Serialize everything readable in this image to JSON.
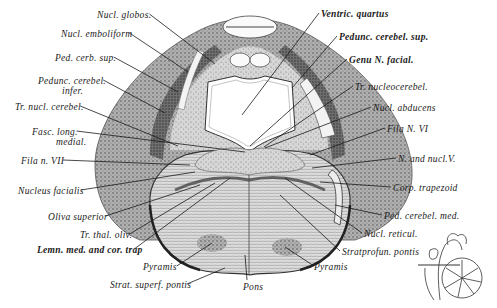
{
  "figure": {
    "labels": [
      {
        "id": "nucl-globos",
        "text": "Nucl. globos.",
        "x": 97,
        "y": 18,
        "anchor": "left",
        "tx": 215,
        "ty": 64,
        "bold": false
      },
      {
        "id": "nucl-emboliform",
        "text": "Nucl. emboliform",
        "x": 61,
        "y": 37,
        "anchor": "left",
        "tx": 188,
        "ty": 72,
        "bold": false
      },
      {
        "id": "ped-cerb-sup",
        "text": "Ped. cerb. sup.",
        "x": 55,
        "y": 61,
        "anchor": "left",
        "tx": 178,
        "ty": 92,
        "bold": false
      },
      {
        "id": "pedunc-cerebel-infer",
        "text": "Pedunc. cerebel.",
        "text2": "infer.",
        "x": 38,
        "y": 84,
        "anchor": "left",
        "tx": 165,
        "ty": 113,
        "bold": false
      },
      {
        "id": "tr-nucl-cerebel",
        "text": "Tr. nucl. cerebel.",
        "x": 15,
        "y": 110,
        "anchor": "left",
        "tx": 178,
        "ty": 146,
        "bold": false
      },
      {
        "id": "fasc-long-medial",
        "text": "Fasc. long.",
        "text2": "medial.",
        "x": 32,
        "y": 135,
        "anchor": "left",
        "tx": 245,
        "ty": 152,
        "bold": false
      },
      {
        "id": "fila-n-vii",
        "text": "Fila n. VII",
        "x": 21,
        "y": 164,
        "anchor": "left",
        "tx": 190,
        "ty": 165,
        "bold": false
      },
      {
        "id": "nucleus-facialis",
        "text": "Nucleus facialis",
        "x": 18,
        "y": 194,
        "anchor": "left",
        "tx": 195,
        "ty": 172,
        "bold": false
      },
      {
        "id": "oliva-superior",
        "text": "Oliva superior",
        "x": 48,
        "y": 220,
        "anchor": "left",
        "tx": 200,
        "ty": 185,
        "bold": false
      },
      {
        "id": "tr-thal-oliv",
        "text": "Tr. thal. oliv.",
        "x": 80,
        "y": 238,
        "anchor": "left",
        "tx": 215,
        "ty": 183,
        "bold": false
      },
      {
        "id": "lemn-med-cor-trap",
        "text": "Lemn. med. and cor. trap",
        "x": 37,
        "y": 253,
        "anchor": "left",
        "tx": 230,
        "ty": 178,
        "bold": true
      },
      {
        "id": "pyramis-left",
        "text": "Pyramis",
        "x": 143,
        "y": 270,
        "anchor": "left",
        "tx": 212,
        "ty": 243,
        "bold": false
      },
      {
        "id": "strat-superf-pontis",
        "text": "Strat. superf. pontis",
        "x": 110,
        "y": 288,
        "anchor": "left",
        "tx": 225,
        "ty": 268,
        "bold": false
      },
      {
        "id": "pons",
        "text": "Pons",
        "x": 243,
        "y": 290,
        "anchor": "left",
        "tx": 245,
        "ty": 255,
        "bold": false
      },
      {
        "id": "ventric-quartus",
        "text": "Ventric. quartus",
        "x": 321,
        "y": 17,
        "anchor": "left",
        "tx": 242,
        "ty": 115,
        "bold": true
      },
      {
        "id": "pedunc-cerebel-sup",
        "text": "Pedunc. cerebel. sup.",
        "x": 339,
        "y": 40,
        "anchor": "left",
        "tx": 292,
        "ty": 88,
        "bold": true
      },
      {
        "id": "genu-n-facial",
        "text": "Genu N. facial.",
        "x": 349,
        "y": 63,
        "anchor": "left",
        "tx": 250,
        "ty": 146,
        "bold": true
      },
      {
        "id": "tr-nucleocerebel",
        "text": "Tr. nucleocerebel.",
        "x": 355,
        "y": 90,
        "anchor": "left",
        "tx": 264,
        "ty": 147,
        "bold": false
      },
      {
        "id": "nucl-abducens",
        "text": "Nucl. abducens",
        "x": 373,
        "y": 111,
        "anchor": "left",
        "tx": 265,
        "ty": 148,
        "bold": false
      },
      {
        "id": "fila-n-vi",
        "text": "Fila N. VI",
        "x": 387,
        "y": 132,
        "anchor": "left",
        "tx": 310,
        "ty": 155,
        "bold": false
      },
      {
        "id": "n-and-nucl-v",
        "text": "N. and nucl.V.",
        "x": 398,
        "y": 162,
        "anchor": "left",
        "tx": 312,
        "ty": 168,
        "bold": false
      },
      {
        "id": "corp-trapezoid",
        "text": "Corp. trapezoid",
        "x": 393,
        "y": 191,
        "anchor": "left",
        "tx": 320,
        "ty": 182,
        "bold": false
      },
      {
        "id": "ped-cerebel-med",
        "text": "Ped. cerebel. med.",
        "x": 384,
        "y": 219,
        "anchor": "left",
        "tx": 335,
        "ty": 205,
        "bold": false
      },
      {
        "id": "nucl-reticul",
        "text": "Nucl. reticul.",
        "x": 364,
        "y": 237,
        "anchor": "left",
        "tx": 285,
        "ty": 178,
        "bold": false
      },
      {
        "id": "stratprofun-pontis",
        "text": "Stratprofun. pontis",
        "x": 342,
        "y": 255,
        "anchor": "left",
        "tx": 280,
        "ty": 195,
        "bold": false
      },
      {
        "id": "pyramis-right",
        "text": "Pyramis",
        "x": 314,
        "y": 270,
        "anchor": "left",
        "tx": 285,
        "ty": 247,
        "bold": false
      }
    ],
    "inset": {
      "description": "orientation inset sketch of brain with cerebellum",
      "x": 418,
      "y": 226,
      "w": 78,
      "h": 82
    },
    "colors": {
      "ink": "#1a1a1a",
      "tissue_dark": "#4a4a4a",
      "tissue_mid": "#8c8c8c",
      "tissue_light": "#bdbdbd",
      "background": "#ffffff"
    }
  }
}
